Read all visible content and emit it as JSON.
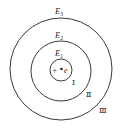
{
  "diagram": {
    "nucleus": {
      "charge_symbol": "+",
      "electron_symbol": "e"
    },
    "orbits": [
      {
        "id": "I",
        "energy_label": "E",
        "energy_sub": "1",
        "roman": "Ⅰ"
      },
      {
        "id": "II",
        "energy_label": "E",
        "energy_sub": "2",
        "roman": "Ⅱ"
      },
      {
        "id": "III",
        "energy_label": "E",
        "energy_sub": "3",
        "roman": "Ⅲ"
      }
    ],
    "colors": {
      "stroke": "#3a3a3a",
      "text": "#2a2a2a",
      "background": "#ffffff"
    }
  }
}
